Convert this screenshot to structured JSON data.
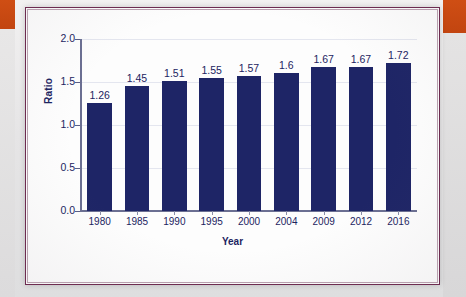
{
  "chart_data": {
    "type": "bar",
    "title": "",
    "xlabel": "Year",
    "ylabel": "Ratio",
    "categories": [
      "1980",
      "1985",
      "1990",
      "1995",
      "2000",
      "2004",
      "2009",
      "2012",
      "2016"
    ],
    "values": [
      1.26,
      1.45,
      1.51,
      1.55,
      1.57,
      1.6,
      1.67,
      1.67,
      1.72
    ],
    "value_labels": [
      "1.26",
      "1.45",
      "1.51",
      "1.55",
      "1.57",
      "1.6",
      "1.67",
      "1.67",
      "1.72"
    ],
    "ylim": [
      0.0,
      2.0
    ],
    "ytick_labels": [
      "0.0",
      "0.5",
      "1.0",
      "1.5",
      "2.0"
    ],
    "ytick_values": [
      0.0,
      0.5,
      1.0,
      1.5,
      2.0
    ],
    "grid": true,
    "legend": null,
    "bar_color": "#1e2566",
    "text_color": "#1c2461",
    "axis_color": "#6b6f92"
  },
  "figure": {
    "frame_color": "#6d2b50",
    "background_color": "#fdfdfd",
    "page_color": "#e6e5e6",
    "accent_block_color": "#c94a13"
  }
}
